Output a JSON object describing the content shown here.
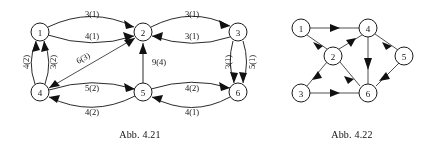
{
  "page": {
    "background_color": "#ffffff",
    "ink_color": "#1a1a1a"
  },
  "figures": [
    {
      "id": "abb-4-21",
      "caption": "Abb. 4.21",
      "caption_x": 140,
      "caption_y": 134,
      "nodes": [
        {
          "id": "n1",
          "label": "1",
          "x": 40,
          "y": 32
        },
        {
          "id": "n2",
          "label": "2",
          "x": 143,
          "y": 32
        },
        {
          "id": "n3",
          "label": "3",
          "x": 238,
          "y": 32
        },
        {
          "id": "n4",
          "label": "4",
          "x": 40,
          "y": 92
        },
        {
          "id": "n5",
          "label": "5",
          "x": 143,
          "y": 92
        },
        {
          "id": "n6",
          "label": "6",
          "x": 238,
          "y": 92
        }
      ],
      "node_radius": 9,
      "edge_labels": [
        {
          "id": "l12a",
          "text": "3(1)",
          "x": 92,
          "y": 14,
          "rotation": 0
        },
        {
          "id": "l12b",
          "text": "4(1)",
          "x": 92,
          "y": 36,
          "rotation": 0
        },
        {
          "id": "l23a",
          "text": "3(1)",
          "x": 192,
          "y": 14,
          "rotation": 0
        },
        {
          "id": "l23b",
          "text": "3(1)",
          "x": 192,
          "y": 36,
          "rotation": 0
        },
        {
          "id": "l14a",
          "text": "4(2)",
          "x": 26,
          "y": 62,
          "rotation": -90
        },
        {
          "id": "l14b",
          "text": "3(2)",
          "x": 53,
          "y": 62,
          "rotation": -90
        },
        {
          "id": "l42",
          "text": "6(3)",
          "x": 83,
          "y": 58,
          "rotation": -29
        },
        {
          "id": "l52",
          "text": "9(4)",
          "x": 159,
          "y": 62,
          "rotation": 0
        },
        {
          "id": "l36a",
          "text": "3(1)",
          "x": 228,
          "y": 62,
          "rotation": -90
        },
        {
          "id": "l36b",
          "text": "5(1)",
          "x": 252,
          "y": 62,
          "rotation": -90
        },
        {
          "id": "l45a",
          "text": "5(2)",
          "x": 92,
          "y": 88,
          "rotation": 0
        },
        {
          "id": "l45b",
          "text": "4(2)",
          "x": 92,
          "y": 112,
          "rotation": 0
        },
        {
          "id": "l56a",
          "text": "4(2)",
          "x": 192,
          "y": 88,
          "rotation": 0
        },
        {
          "id": "l56b",
          "text": "4(1)",
          "x": 192,
          "y": 112,
          "rotation": 0
        }
      ],
      "edges": [
        {
          "id": "e12top",
          "from": "n1",
          "to": "n2",
          "style": "arc-up",
          "capacity": 3,
          "flow": 1
        },
        {
          "id": "e12bot",
          "from": "n1",
          "to": "n2",
          "style": "arc-down",
          "capacity": 4,
          "flow": 1
        },
        {
          "id": "e23top",
          "from": "n2",
          "to": "n3",
          "style": "arc-up",
          "capacity": 3,
          "flow": 1
        },
        {
          "id": "e32bot",
          "from": "n3",
          "to": "n2",
          "style": "arc-down",
          "capacity": 3,
          "flow": 1
        },
        {
          "id": "e41left",
          "from": "n4",
          "to": "n1",
          "style": "arc-left",
          "capacity": 4,
          "flow": 2
        },
        {
          "id": "e41right",
          "from": "n4",
          "to": "n1",
          "style": "arc-right",
          "capacity": 3,
          "flow": 2
        },
        {
          "id": "e42",
          "from": "n4",
          "to": "n2",
          "style": "diagonal",
          "capacity": 6,
          "flow": 3
        },
        {
          "id": "e52",
          "from": "n5",
          "to": "n2",
          "style": "straight",
          "capacity": 9,
          "flow": 4
        },
        {
          "id": "e36left",
          "from": "n3",
          "to": "n6",
          "style": "arc-left",
          "capacity": 3,
          "flow": 1
        },
        {
          "id": "e36right",
          "from": "n3",
          "to": "n6",
          "style": "arc-right",
          "capacity": 5,
          "flow": 1
        },
        {
          "id": "e54top",
          "from": "n5",
          "to": "n4",
          "style": "arc-up",
          "capacity": 5,
          "flow": 2
        },
        {
          "id": "e45bot",
          "from": "n4",
          "to": "n5",
          "style": "arc-down",
          "capacity": 4,
          "flow": 2
        },
        {
          "id": "e56top",
          "from": "n5",
          "to": "n6",
          "style": "arc-up",
          "capacity": 4,
          "flow": 2
        },
        {
          "id": "e65bot",
          "from": "n6",
          "to": "n5",
          "style": "arc-down",
          "capacity": 4,
          "flow": 1
        }
      ]
    },
    {
      "id": "abb-4-22",
      "caption": "Abb. 4.22",
      "caption_x": 352,
      "caption_y": 134,
      "nodes": [
        {
          "id": "m1",
          "label": "1",
          "x": 301,
          "y": 28
        },
        {
          "id": "m4",
          "label": "4",
          "x": 368,
          "y": 28
        },
        {
          "id": "m2",
          "label": "2",
          "x": 333,
          "y": 56
        },
        {
          "id": "m5",
          "label": "5",
          "x": 404,
          "y": 56
        },
        {
          "id": "m3",
          "label": "3",
          "x": 301,
          "y": 93
        },
        {
          "id": "m6",
          "label": "6",
          "x": 368,
          "y": 93
        }
      ],
      "node_radius": 9,
      "edges": [
        {
          "id": "f14",
          "from": "m1",
          "to": "m4",
          "direction": "right"
        },
        {
          "id": "f12",
          "from": "m1",
          "to": "m2",
          "direction": "down-right"
        },
        {
          "id": "f24",
          "from": "m2",
          "to": "m4",
          "direction": "up-right"
        },
        {
          "id": "f23",
          "from": "m2",
          "to": "m3",
          "direction": "down-left"
        },
        {
          "id": "f26",
          "from": "m2",
          "to": "m6",
          "direction": "down-right"
        },
        {
          "id": "f36",
          "from": "m3",
          "to": "m6",
          "direction": "right"
        },
        {
          "id": "f46",
          "from": "m4",
          "to": "m6",
          "direction": "down"
        },
        {
          "id": "f45",
          "from": "m4",
          "to": "m5",
          "direction": "down-right"
        },
        {
          "id": "f56",
          "from": "m5",
          "to": "m6",
          "direction": "down-left"
        }
      ]
    }
  ]
}
